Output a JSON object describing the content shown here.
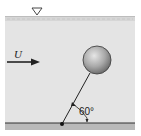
{
  "diagram": {
    "type": "fluid-mechanics-figure",
    "free_surface_symbol": "▽",
    "flow": {
      "label": "U",
      "direction": "right"
    },
    "sphere": {
      "label": ""
    },
    "tether": {
      "angle_label": "60°",
      "angle_deg": 60
    },
    "colors": {
      "water": "#e4e4e4",
      "surface": "#c8c8c8",
      "ground": "#b9b9b9",
      "line": "#222222",
      "sphere_light": "#d8d8d8",
      "sphere_dark": "#7c7c7c"
    }
  }
}
